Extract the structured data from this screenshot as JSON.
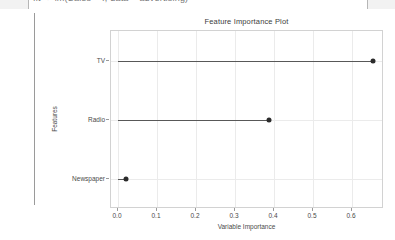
{
  "topbar": {
    "text": "fit <- lm(Sales ~ ., data = advertising)"
  },
  "chart_data": {
    "type": "scatter",
    "orientation": "horizontal",
    "title": "Feature Importance Plot",
    "xlabel": "Variable Importance",
    "ylabel": "Features",
    "categories": [
      "Newspaper",
      "Radio",
      "TV"
    ],
    "values": [
      0.02,
      0.386,
      0.655
    ],
    "points": [
      {
        "feature": "TV",
        "importance": 0.655
      },
      {
        "feature": "Radio",
        "importance": 0.386
      },
      {
        "feature": "Newspaper",
        "importance": 0.02
      }
    ],
    "xlim": [
      -0.018,
      0.682
    ],
    "xticks": [
      0.0,
      0.1,
      0.2,
      0.3,
      0.4,
      0.5,
      0.6
    ],
    "xticklabels": [
      "0.0",
      "0.1",
      "0.2",
      "0.3",
      "0.4",
      "0.5",
      "0.6"
    ],
    "grid": true,
    "legend": null,
    "marker_color": "#2b2b2b",
    "segment_color": "#585858",
    "panel_bg": "#ffffff",
    "grid_color": "#ebebeb"
  }
}
